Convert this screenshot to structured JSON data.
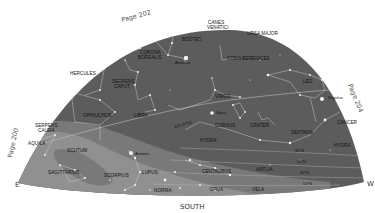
{
  "map": {
    "type": "star-chart",
    "colors": {
      "sky": "#5c5c5c",
      "milky_way": "#8a8a8a",
      "milky_way_light": "#a0a0a0",
      "stars": "#f4f4f4",
      "lines": "#d0d0d0",
      "labels": "#111111",
      "background": "#ffffff"
    },
    "page_refs": [
      {
        "label": "Page 202",
        "position": "top-left-edge"
      },
      {
        "label": "Page 204",
        "position": "right-edge"
      },
      {
        "label": "Page 200",
        "position": "left-edge"
      }
    ],
    "compass": {
      "east": "E",
      "west": "W",
      "south": "SOUTH"
    },
    "constellations": [
      {
        "name": "CANES",
        "name2": "VENATICI"
      },
      {
        "name": "BOÖTES"
      },
      {
        "name": "URSA MAJOR"
      },
      {
        "name": "CORONA",
        "name2": "BOREALIS"
      },
      {
        "name": "COMA BERENICES"
      },
      {
        "name": "HERCULES"
      },
      {
        "name": "SERPENS",
        "name2": "CAPUT"
      },
      {
        "name": "LEO"
      },
      {
        "name": "VIRGO"
      },
      {
        "name": "OPHIUCHUS"
      },
      {
        "name": "LIBRA"
      },
      {
        "name": "SERPENS",
        "name2": "CAUDA"
      },
      {
        "name": "AQUILA"
      },
      {
        "name": "SCUTUM"
      },
      {
        "name": "CORVUS"
      },
      {
        "name": "CRATER"
      },
      {
        "name": "SEXTANS"
      },
      {
        "name": "CANCER"
      },
      {
        "name": "HYDRA"
      },
      {
        "name": "HYDRA"
      },
      {
        "name": "SAGITTARIUS"
      },
      {
        "name": "SCORPIUS"
      },
      {
        "name": "LUPUS"
      },
      {
        "name": "CENTAURUS"
      },
      {
        "name": "ANTLIA"
      },
      {
        "name": "NORMA"
      },
      {
        "name": "CRUX"
      },
      {
        "name": "VELA"
      }
    ],
    "stars": [
      {
        "name": "Arcturus"
      },
      {
        "name": "Regulus"
      },
      {
        "name": "Spica"
      },
      {
        "name": "Antares"
      }
    ],
    "ecliptic_label": "ECLIPTIC",
    "latitude_labels": [
      "30°N",
      "10°N",
      "40°N",
      "50°N"
    ]
  }
}
